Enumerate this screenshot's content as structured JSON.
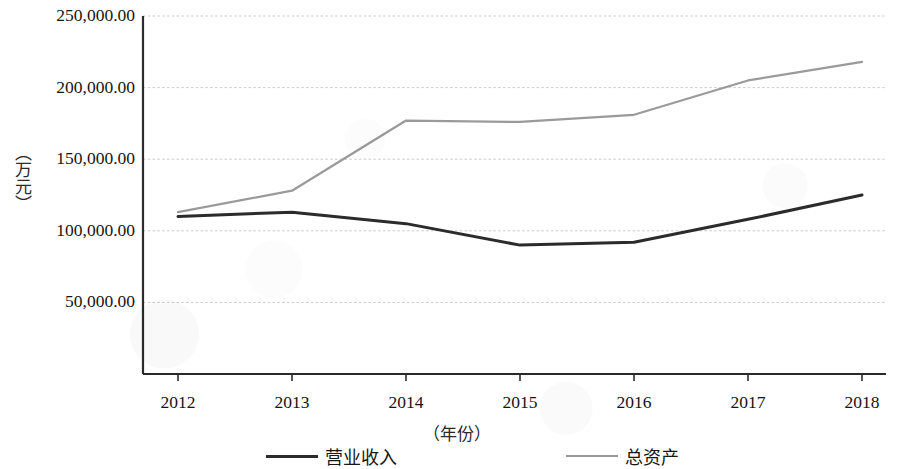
{
  "chart_data": {
    "type": "line",
    "title": "",
    "xlabel": "（年份）",
    "ylabel": "（万元）",
    "categories": [
      "2012",
      "2013",
      "2014",
      "2015",
      "2016",
      "2017",
      "2018"
    ],
    "x": [
      2012,
      2013,
      2014,
      2015,
      2016,
      2017,
      2018
    ],
    "ylim": [
      0,
      250000
    ],
    "xlim": [
      2012,
      2018
    ],
    "grid": true,
    "grid_axis": "y",
    "legend_position": "bottom",
    "y_tick_values": [
      50000,
      100000,
      150000,
      200000,
      250000
    ],
    "y_tick_labels": [
      "50,000.00",
      "100,000.00",
      "150,000.00",
      "200,000.00",
      "250,000.00"
    ],
    "series": [
      {
        "name": "营业收入",
        "color": "#2b2b2b",
        "values": [
          110000,
          113000,
          105000,
          90000,
          92000,
          108000,
          125000
        ]
      },
      {
        "name": "总资产",
        "color": "#9a9a9a",
        "values": [
          113000,
          128000,
          177000,
          176000,
          181000,
          205000,
          218000
        ]
      }
    ]
  },
  "axis": {
    "y_unit_label": "（万元）",
    "x_unit_label": "（年份）"
  },
  "legend": {
    "entries": [
      {
        "label": "营业收入",
        "swatch": "solid-dark-line"
      },
      {
        "label": "总资产",
        "swatch": "solid-gray-line"
      }
    ]
  }
}
